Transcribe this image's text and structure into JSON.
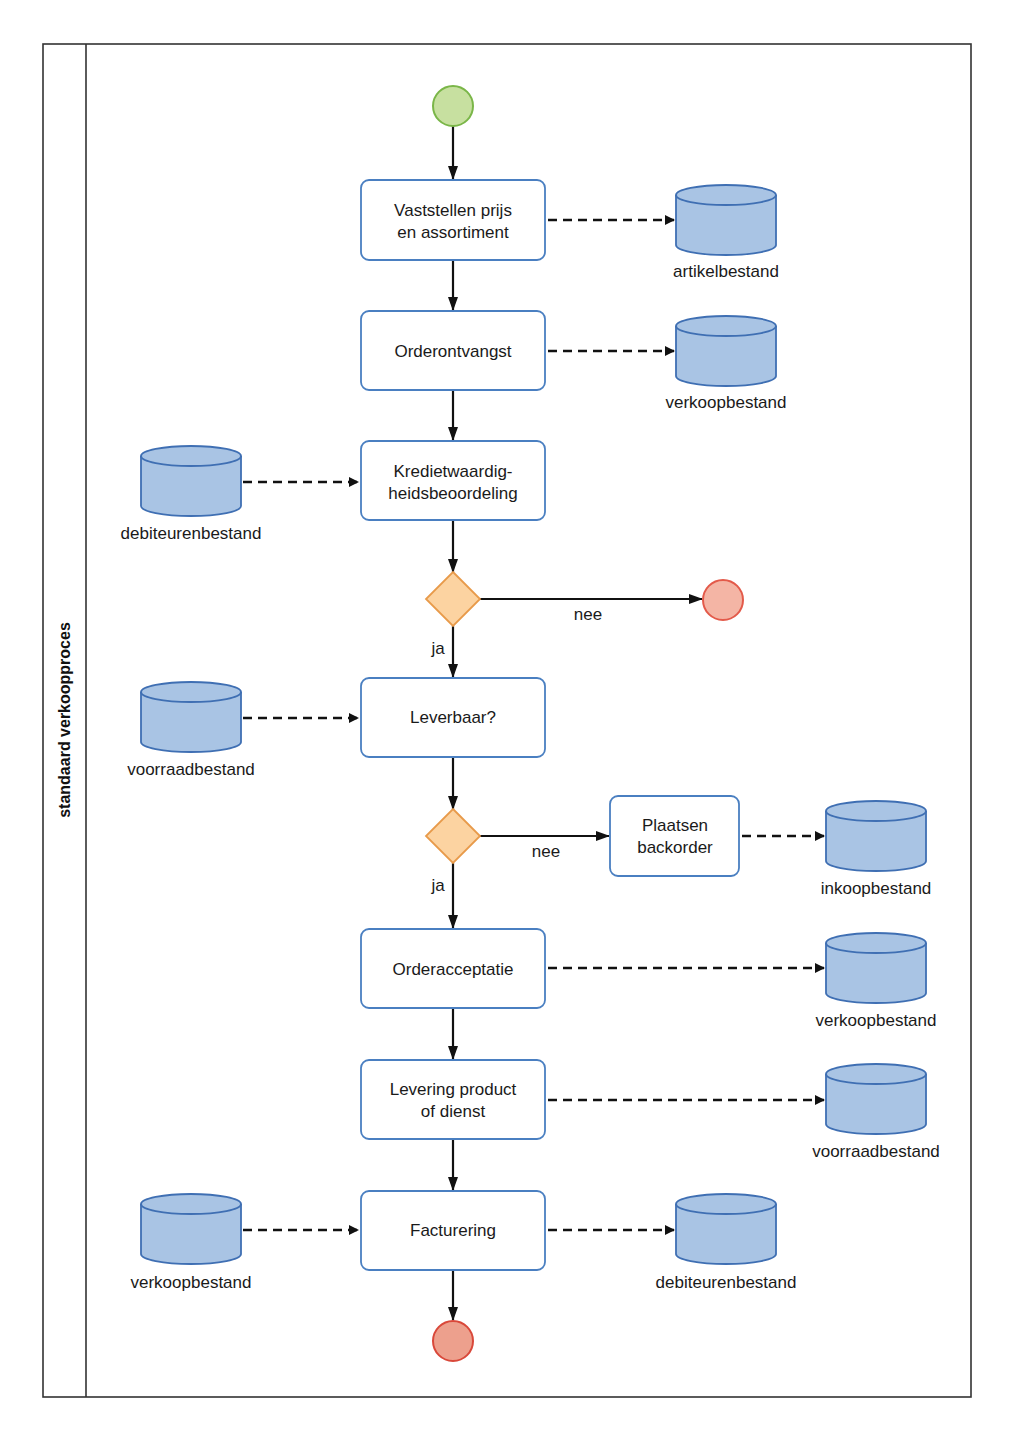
{
  "diagram": {
    "type": "BPMN process (swimlane)",
    "lane": {
      "label": "standaard verkoopproces"
    },
    "colors": {
      "frame": "#333333",
      "task_fill": "#ffffff",
      "task_stroke": "#4a7fc1",
      "datastore_fill": "#a9c4e4",
      "datastore_stroke": "#3f6fb3",
      "gateway_fill": "#fcd3a1",
      "gateway_stroke": "#e89a4a",
      "start_fill": "#c7e0a0",
      "start_stroke": "#7ab648",
      "end_fill": "#f4b5a5",
      "end_stroke": "#e35a4a",
      "flow": "#111111"
    },
    "events": [
      {
        "id": "start",
        "kind": "start-event"
      },
      {
        "id": "end_rejected",
        "kind": "end-event"
      },
      {
        "id": "end",
        "kind": "end-event"
      }
    ],
    "tasks": [
      {
        "id": "t1",
        "lines": [
          "Vaststellen prijs",
          "en assortiment"
        ]
      },
      {
        "id": "t2",
        "lines": [
          "Orderontvangst"
        ]
      },
      {
        "id": "t3",
        "lines": [
          "Kredietwaardig-",
          "heidsbeoordeling"
        ]
      },
      {
        "id": "t4",
        "lines": [
          "Leverbaar?"
        ]
      },
      {
        "id": "t5",
        "lines": [
          "Plaatsen",
          "backorder"
        ]
      },
      {
        "id": "t6",
        "lines": [
          "Orderacceptatie"
        ]
      },
      {
        "id": "t7",
        "lines": [
          "Levering product",
          "of dienst"
        ]
      },
      {
        "id": "t8",
        "lines": [
          "Facturering"
        ]
      }
    ],
    "gateways": [
      {
        "id": "g1",
        "yes_label": "ja",
        "no_label": "nee"
      },
      {
        "id": "g2",
        "yes_label": "ja",
        "no_label": "nee"
      }
    ],
    "datastores": [
      {
        "id": "d1",
        "label": "artikelbestand",
        "connects": "t1 → d1"
      },
      {
        "id": "d2",
        "label": "verkoopbestand",
        "connects": "t2 → d2"
      },
      {
        "id": "d3",
        "label": "debiteurenbestand",
        "connects": "d3 → t3"
      },
      {
        "id": "d4",
        "label": "voorraadbestand",
        "connects": "d4 → t4"
      },
      {
        "id": "d5",
        "label": "inkoopbestand",
        "connects": "t5 → d5"
      },
      {
        "id": "d6",
        "label": "verkoopbestand",
        "connects": "t6 → d6"
      },
      {
        "id": "d7",
        "label": "voorraadbestand",
        "connects": "t7 → d7"
      },
      {
        "id": "d8",
        "label": "verkoopbestand",
        "connects": "d8 → t8"
      },
      {
        "id": "d9",
        "label": "debiteurenbestand",
        "connects": "t8 → d9"
      }
    ],
    "sequence_flows": [
      "start → t1",
      "t1 → t2",
      "t2 → t3",
      "t3 → g1",
      "g1 (nee) → end_rejected",
      "g1 (ja) → t4",
      "t4 → g2",
      "g2 (nee) → t5",
      "g2 (ja) → t6",
      "t6 → t7",
      "t7 → t8",
      "t8 → end"
    ]
  }
}
